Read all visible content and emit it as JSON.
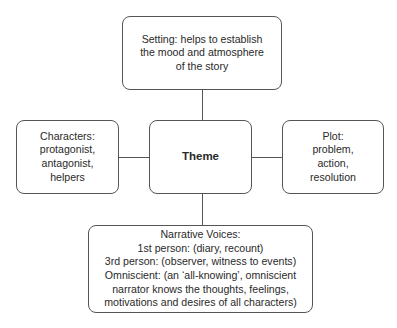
{
  "diagram": {
    "center": {
      "label": "Theme"
    },
    "setting": {
      "lines": [
        "Setting: helps to establish",
        "the mood and atmosphere",
        "of the story"
      ]
    },
    "characters": {
      "lines": [
        "Characters:",
        "protagonist,",
        "antagonist,",
        "helpers"
      ]
    },
    "plot": {
      "lines": [
        "Plot:",
        "problem,",
        "action,",
        "resolution"
      ]
    },
    "narrative": {
      "lines": [
        "Narrative Voices:",
        "1st person: (diary, recount)",
        "3rd person: (observer, witness to events)",
        "Omniscient: (an ‘all-knowing’, omniscient",
        "narrator knows the thoughts, feelings,",
        "motivations and desires of all characters)"
      ]
    },
    "colors": {
      "border": "#555555",
      "text": "#2a2a2a",
      "background": "#ffffff"
    }
  }
}
